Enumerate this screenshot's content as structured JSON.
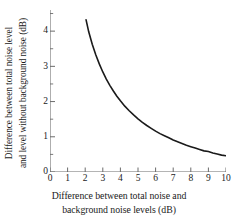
{
  "chart_data": {
    "type": "line",
    "title": "",
    "xlabel": "Difference between total noise and background noise levels (dB)",
    "xlabel_lines": [
      "Difference between total noise and",
      "background noise levels (dB)"
    ],
    "ylabel": "Difference between total noise level and level without background noise (dB)",
    "ylabel_lines": [
      "Difference between total noise level",
      "and level without background noise (dB)"
    ],
    "xlim": [
      0,
      10
    ],
    "ylim": [
      0,
      4.6
    ],
    "xticks": [
      0,
      1,
      2,
      3,
      4,
      5,
      6,
      7,
      8,
      9,
      10
    ],
    "xtick_labels": [
      "0",
      "1",
      "2",
      "3",
      "4",
      "5",
      "6",
      "7",
      "8",
      "9",
      "10"
    ],
    "yticks": [
      0,
      1,
      2,
      3,
      4
    ],
    "ytick_labels": [
      "0",
      "1",
      "2",
      "3",
      "4"
    ],
    "y_minor_ticks": [
      0.5,
      1.5,
      2.5,
      3.5,
      4.5
    ],
    "grid": false,
    "legend": null,
    "legend_position": "none",
    "series": [
      {
        "name": "Background noise correction",
        "color": "#1a1a1a",
        "line_width": 1.6,
        "x": [
          2.05,
          2.2,
          2.4,
          2.6,
          2.8,
          3.0,
          3.2,
          3.4,
          3.6,
          3.8,
          4.0,
          4.25,
          4.5,
          4.75,
          5.0,
          5.25,
          5.5,
          5.75,
          6.0,
          6.25,
          6.5,
          6.75,
          7.0,
          7.25,
          7.5,
          7.75,
          8.0,
          8.25,
          8.5,
          8.75,
          9.0,
          9.25,
          9.5,
          9.75,
          10.0
        ],
        "y": [
          4.32,
          3.98,
          3.63,
          3.33,
          3.07,
          2.84,
          2.64,
          2.46,
          2.3,
          2.15,
          2.02,
          1.87,
          1.74,
          1.62,
          1.51,
          1.41,
          1.32,
          1.24,
          1.16,
          1.09,
          1.03,
          0.97,
          0.91,
          0.86,
          0.81,
          0.76,
          0.72,
          0.68,
          0.64,
          0.6,
          0.58,
          0.54,
          0.51,
          0.48,
          0.46
        ]
      }
    ],
    "axis_color": "#6b6b6b",
    "curve_color": "#1a1a1a",
    "background_color": "#ffffff"
  }
}
